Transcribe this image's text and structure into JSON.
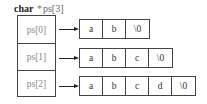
{
  "title": {
    "type": "char",
    "star": "*",
    "ident": "ps[3]"
  },
  "pointers": [
    {
      "label": "ps[0]",
      "chars": [
        "a",
        "b",
        "\\0"
      ]
    },
    {
      "label": "ps[1]",
      "chars": [
        "a",
        "b",
        "c",
        "\\0"
      ]
    },
    {
      "label": "ps[2]",
      "chars": [
        "a",
        "b",
        "c",
        "d",
        "\\0"
      ]
    }
  ]
}
